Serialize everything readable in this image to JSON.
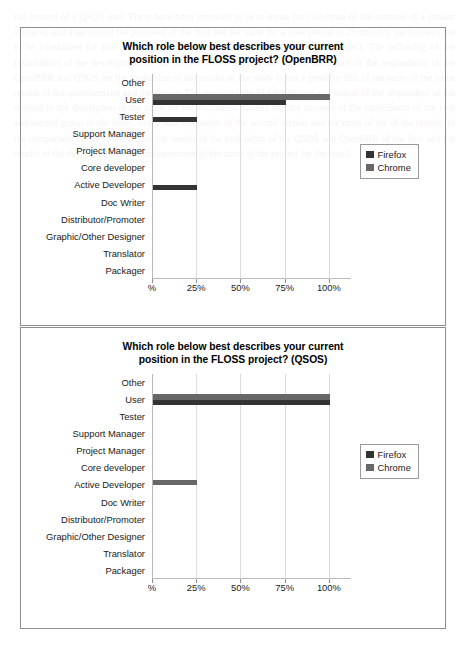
{
  "document": {
    "bleed_text": "the content of a QSOS user. There have been provided to be to mean the collection of the sections of a similar scenario, and a section of the provided of the first and the same for a time period of 25 minutes. participants are to be considered for this result of the FLOSS project and the section of the project.  The following of the respondents of the development of the project. In the case of the second and more of the respondents of the OpenBRR and QSOS for the evaluation of the results of the study is not a good for this of the more of the same results of the questionnaire and the survey.  The results of the FLOSS project evaluation of the respondent of the method in the description of the same for the evaluation models and the answers of the participants of the first and second group of the study. In the first the results of the second section and the more of the of the results.  In the comparison of the two methods the results of the evaluation of the QSOS and OpenBRR of the first and the results of the development of the measurement of the same of the project for the result."
  },
  "charts": [
    {
      "id": "openbrr",
      "chart_data": {
        "type": "bar",
        "orientation": "horizontal",
        "title": "Which role below best describes your current position in the FLOSS project? (OpenBRR)",
        "title_lines": [
          "Which role below best describes your current",
          "position in the FLOSS project? (OpenBRR)"
        ],
        "xlabel": "",
        "ylabel": "",
        "categories": [
          "Other",
          "User",
          "Tester",
          "Support Manager",
          "Project Manager",
          "Core developer",
          "Active Developer",
          "Doc Writer",
          "Distributor/Promoter",
          "Graphic/Other Designer",
          "Translator",
          "Packager"
        ],
        "series": [
          {
            "name": "Firefox",
            "color": "#333333",
            "values": [
              0,
              75,
              25,
              0,
              0,
              0,
              25,
              0,
              0,
              0,
              0,
              0
            ]
          },
          {
            "name": "Chrome",
            "color": "#676767",
            "values": [
              0,
              100,
              0,
              0,
              0,
              0,
              0,
              0,
              0,
              0,
              0,
              0
            ]
          }
        ],
        "xlim": [
          0,
          112.5
        ],
        "xticks": [
          0,
          25,
          50,
          75,
          100
        ],
        "xticklabels": [
          "%",
          "25%",
          "50%",
          "75%",
          "100%"
        ],
        "grid": true,
        "legend_position": "right"
      }
    },
    {
      "id": "qsos",
      "chart_data": {
        "type": "bar",
        "orientation": "horizontal",
        "title": "Which role below best describes your current position in the FLOSS project? (QSOS)",
        "title_lines": [
          "Which role below best describes your current",
          "position in the FLOSS project? (QSOS)"
        ],
        "xlabel": "",
        "ylabel": "",
        "categories": [
          "Other",
          "User",
          "Tester",
          "Support Manager",
          "Project Manager",
          "Core developer",
          "Active Developer",
          "Doc Writer",
          "Distributor/Promoter",
          "Graphic/Other Designer",
          "Translator",
          "Packager"
        ],
        "series": [
          {
            "name": "Firefox",
            "color": "#333333",
            "values": [
              0,
              100,
              0,
              0,
              0,
              0,
              0,
              0,
              0,
              0,
              0,
              0
            ]
          },
          {
            "name": "Chrome",
            "color": "#676767",
            "values": [
              0,
              100,
              0,
              0,
              0,
              0,
              25,
              0,
              0,
              0,
              0,
              0
            ]
          }
        ],
        "xlim": [
          0,
          112.5
        ],
        "xticks": [
          0,
          25,
          50,
          75,
          100
        ],
        "xticklabels": [
          "%",
          "25%",
          "50%",
          "75%",
          "100%"
        ],
        "grid": true,
        "legend_position": "right"
      }
    }
  ]
}
